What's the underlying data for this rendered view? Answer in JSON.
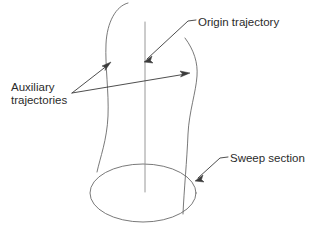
{
  "figure": {
    "type": "technical-line-diagram",
    "background_color": "#ffffff",
    "geometry_color": "#6a6a6a",
    "axis_color": "#8d8d8d",
    "leader_color": "#3a3a3a",
    "text_color": "#2b2b2b"
  },
  "labels": {
    "origin_trajectory": "Origin trajectory",
    "auxiliary_trajectories_line1": "Auxiliary",
    "auxiliary_trajectories_line2": "trajectories",
    "sweep_section": "Sweep section"
  },
  "annotations": [
    {
      "id": "origin-trajectory",
      "text": "Origin trajectory",
      "text_x": 198,
      "text_y": 26,
      "target_x": 145,
      "target_y": 61,
      "target_element": "vertical-center-axis"
    },
    {
      "id": "auxiliary-trajectories",
      "text": "Auxiliary trajectories",
      "text_x": 11,
      "text_y": 91,
      "vertex_x": 72,
      "vertex_y": 93,
      "target_left_x": 110,
      "target_left_y": 62,
      "target_right_x": 189,
      "target_right_y": 73,
      "target_element": "left-and-right-profile-curves"
    },
    {
      "id": "sweep-section",
      "text": "Sweep section",
      "text_x": 230,
      "text_y": 162,
      "target_x": 196,
      "target_y": 181,
      "target_element": "base-ellipse"
    }
  ],
  "geometry": {
    "base_ellipse": {
      "center_x": 143,
      "center_y": 193,
      "radius_x": 53,
      "radius_y": 29
    },
    "center_axis": {
      "x": 145,
      "y_top": 22,
      "y_bottom": 192
    },
    "left_profile_path": "M 128 3 C 116 6 107 22 106 44 C 105 66 109 92 108 116 C 107 140 100 158 97 172",
    "right_profile_path": "M 185 38 C 194 50 198 63 197 76 C 196 92 189 112 188 134 C 187 160 184 190 183 214",
    "left_profile_base_x": 97,
    "right_profile_base_x": 183
  }
}
